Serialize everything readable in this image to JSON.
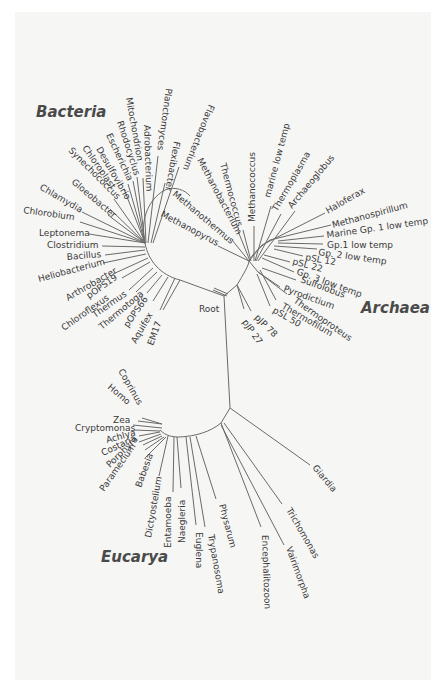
{
  "diagram": {
    "type": "unrooted phylogenetic tree",
    "colors": {
      "background": "#ffffff",
      "paper": "#f6f6f5",
      "lines": "#6a6a6a",
      "text": "#3a3a3a",
      "domain_text": "#4a4a4a"
    },
    "domains": [
      {
        "id": "bacteria",
        "label": "Bacteria",
        "x": 36,
        "y": 117
      },
      {
        "id": "archaea",
        "label": "Archaea",
        "x": 361,
        "y": 313
      },
      {
        "id": "eucarya",
        "label": "Eucarya",
        "x": 101,
        "y": 562
      }
    ],
    "root": {
      "label": "Root",
      "x": 199,
      "y": 312
    },
    "nodes": {
      "bacteria_hub": [
        145,
        243
      ],
      "archaea_hub": [
        249,
        261
      ],
      "center": [
        224,
        296
      ],
      "eucarya_hub": [
        230,
        408
      ],
      "eucarya_sub": [
        221,
        423
      ],
      "eucarya_arc_start": [
        160,
        424
      ]
    },
    "leaves": [
      {
        "group": "bacteria",
        "label": "Chlamydia",
        "x": 39,
        "y": 189,
        "angle": 30,
        "line": [
          [
            82,
            212
          ],
          [
            145,
            243
          ]
        ]
      },
      {
        "group": "bacteria",
        "label": "Chlorobium",
        "x": 23,
        "y": 213,
        "angle": 8,
        "line": [
          [
            80,
            222
          ],
          [
            145,
            243
          ]
        ]
      },
      {
        "group": "bacteria",
        "label": "Leptonema",
        "x": 39,
        "y": 236,
        "angle": 0,
        "line": [
          [
            89,
            234
          ],
          [
            145,
            243
          ]
        ]
      },
      {
        "group": "bacteria",
        "label": "Clostridium",
        "x": 47,
        "y": 248,
        "angle": 0,
        "line": [
          [
            102,
            246
          ],
          [
            145,
            247
          ]
        ]
      },
      {
        "group": "bacteria",
        "label": "Bacillus",
        "x": 67,
        "y": 260,
        "angle": -5,
        "line": [
          [
            105,
            255
          ],
          [
            145,
            250
          ]
        ]
      },
      {
        "group": "bacteria",
        "label": "Heliobacterium",
        "x": 39,
        "y": 282,
        "angle": -15,
        "line": [
          [
            103,
            263
          ],
          [
            146,
            254
          ]
        ]
      },
      {
        "group": "bacteria",
        "label": "Arthrobacter",
        "x": 68,
        "y": 301,
        "angle": -30,
        "line": [
          [
            113,
            274
          ],
          [
            148,
            258
          ]
        ]
      },
      {
        "group": "bacteria",
        "label": "pOPS19",
        "x": 89,
        "y": 299,
        "angle": -35,
        "line": [
          [
            122,
            278
          ],
          [
            150,
            262
          ]
        ]
      },
      {
        "group": "bacteria",
        "label": "Chloroflexus",
        "x": 64,
        "y": 331,
        "angle": -35,
        "line": [
          [
            129,
            290
          ],
          [
            153,
            268
          ]
        ]
      },
      {
        "group": "bacteria",
        "label": "Thermus",
        "x": 95,
        "y": 318,
        "angle": -35,
        "line": [
          [
            136,
            292
          ],
          [
            157,
            272
          ]
        ]
      },
      {
        "group": "bacteria",
        "label": "Thermotoga",
        "x": 102,
        "y": 330,
        "angle": -40,
        "line": [
          [
            147,
            293
          ],
          [
            162,
            275
          ]
        ]
      },
      {
        "group": "bacteria",
        "label": "pOPS66",
        "x": 128,
        "y": 328,
        "angle": -55,
        "line": [
          [
            153,
            301
          ],
          [
            168,
            277
          ]
        ]
      },
      {
        "group": "bacteria",
        "label": "Aquifex",
        "x": 136,
        "y": 344,
        "angle": -60,
        "line": [
          [
            160,
            310
          ],
          [
            175,
            278
          ]
        ]
      },
      {
        "group": "bacteria",
        "label": "EM17",
        "x": 153,
        "y": 346,
        "angle": -70,
        "line": [
          [
            163,
            310
          ],
          [
            180,
            280
          ]
        ]
      },
      {
        "group": "bacteria",
        "label": "Synechococcus",
        "x": 68,
        "y": 151,
        "angle": 45,
        "line": [
          [
            110,
            209
          ],
          [
            145,
            243
          ]
        ]
      },
      {
        "group": "bacteria",
        "label": "Chloroplast",
        "x": 82,
        "y": 148,
        "angle": 55,
        "line": [
          [
            114,
            199
          ],
          [
            145,
            243
          ]
        ]
      },
      {
        "group": "bacteria",
        "label": "Gloeobacter",
        "x": 71,
        "y": 183,
        "angle": 40,
        "line": [
          [
            108,
            215
          ],
          [
            145,
            243
          ]
        ]
      },
      {
        "group": "bacteria",
        "label": "Desulfovibrio",
        "x": 96,
        "y": 149,
        "angle": 60,
        "line": [
          [
            124,
            189
          ],
          [
            145,
            243
          ]
        ]
      },
      {
        "group": "bacteria",
        "label": "Escherichia",
        "x": 106,
        "y": 135,
        "angle": 65,
        "line": [
          [
            128,
            184
          ],
          [
            145,
            243
          ]
        ]
      },
      {
        "group": "bacteria",
        "label": "Rhodocyclus",
        "x": 117,
        "y": 122,
        "angle": 72,
        "line": [
          [
            133,
            181
          ],
          [
            145,
            243
          ]
        ]
      },
      {
        "group": "bacteria",
        "label": "Mitochondrion",
        "x": 126,
        "y": 98,
        "angle": 80,
        "line": [
          [
            137,
            177
          ],
          [
            145,
            243
          ]
        ]
      },
      {
        "group": "bacteria",
        "label": "Adrobacterium",
        "x": 144,
        "y": 125,
        "angle": 88,
        "line": [
          [
            143,
            178
          ],
          [
            146,
            243
          ]
        ]
      },
      {
        "group": "bacteria",
        "label": "Planctomyces",
        "x": 166,
        "y": 88,
        "angle": 98,
        "line": [
          [
            158,
            156
          ],
          [
            148,
            243
          ]
        ]
      },
      {
        "group": "bacteria",
        "label": "Flexibacter",
        "x": 174,
        "y": 141,
        "angle": 100,
        "line": [
          [
            165,
            183
          ],
          [
            151,
            243
          ]
        ]
      },
      {
        "group": "bacteria",
        "label": "Flavobacterium",
        "x": 209,
        "y": 104,
        "angle": 112,
        "line": [
          [
            179,
            167
          ],
          [
            153,
            243
          ]
        ]
      },
      {
        "group": "archaea",
        "label": "Methanopyrus",
        "x": 160,
        "y": 216,
        "angle": 28,
        "line": [
          [
            218,
            246
          ],
          [
            249,
            261
          ]
        ]
      },
      {
        "group": "archaea",
        "label": "Methanothermus",
        "x": 172,
        "y": 195,
        "angle": 40,
        "line": [
          [
            232,
            240
          ],
          [
            249,
            261
          ]
        ]
      },
      {
        "group": "archaea",
        "label": "Methanobacterium",
        "x": 197,
        "y": 160,
        "angle": 62,
        "line": [
          [
            238,
            231
          ],
          [
            250,
            261
          ]
        ]
      },
      {
        "group": "archaea",
        "label": "Thermococcus",
        "x": 220,
        "y": 164,
        "angle": 75,
        "line": [
          [
            243,
            230
          ],
          [
            251,
            261
          ]
        ]
      },
      {
        "group": "archaea",
        "label": "Methanococcus",
        "x": 255,
        "y": 222,
        "angle": -90,
        "line": [
          [
            254,
            226
          ],
          [
            254,
            261
          ]
        ]
      },
      {
        "group": "archaea",
        "label": "marine low temp",
        "x": 270,
        "y": 198,
        "angle": -75,
        "line": [
          [
            271,
            206
          ],
          [
            255,
            261
          ]
        ]
      },
      {
        "group": "archaea",
        "label": "Thermoplasma",
        "x": 277,
        "y": 212,
        "angle": -60,
        "line": [
          [
            281,
            214
          ],
          [
            256,
            261
          ]
        ]
      },
      {
        "group": "archaea",
        "label": "Archaeoglobus",
        "x": 292,
        "y": 209,
        "angle": -50,
        "line": [
          [
            295,
            211
          ],
          [
            258,
            261
          ]
        ]
      },
      {
        "group": "archaea",
        "label": "Haloferax",
        "x": 328,
        "y": 214,
        "angle": -30,
        "line": [
          [
            325,
            213
          ],
          [
            262,
            245
          ]
        ]
      },
      {
        "group": "archaea",
        "label": "Methanospirillum",
        "x": 333,
        "y": 228,
        "angle": -15,
        "line": [
          [
            331,
            225
          ],
          [
            270,
            240
          ]
        ]
      },
      {
        "group": "archaea",
        "label": "Marine Gp. 1 low temp",
        "x": 327,
        "y": 238,
        "angle": -8,
        "line": [
          [
            324,
            236
          ],
          [
            278,
            241
          ]
        ]
      },
      {
        "group": "archaea",
        "label": "Gp.1 low temp",
        "x": 327,
        "y": 248,
        "angle": 0,
        "line": [
          [
            323,
            244
          ],
          [
            278,
            243
          ]
        ]
      },
      {
        "group": "archaea",
        "label": "Gp. 2 low temp",
        "x": 318,
        "y": 255,
        "angle": 8,
        "line": [
          [
            317,
            249
          ],
          [
            274,
            246
          ]
        ]
      },
      {
        "group": "archaea",
        "label": "pSL 12",
        "x": 305,
        "y": 260,
        "angle": 10,
        "line": [
          [
            303,
            256
          ],
          [
            274,
            249
          ]
        ]
      },
      {
        "group": "archaea",
        "label": "pSL 22",
        "x": 292,
        "y": 264,
        "angle": 15,
        "line": [
          [
            290,
            262
          ],
          [
            264,
            255
          ]
        ]
      },
      {
        "group": "archaea",
        "label": "Gp. 3 low temp",
        "x": 296,
        "y": 274,
        "angle": 20,
        "line": [
          [
            294,
            272
          ],
          [
            262,
            258
          ]
        ]
      },
      {
        "group": "archaea",
        "label": "Sulfolobus",
        "x": 300,
        "y": 282,
        "angle": 20,
        "line": [
          [
            296,
            280
          ],
          [
            262,
            268
          ]
        ]
      },
      {
        "group": "archaea",
        "label": "Pyrodictium",
        "x": 283,
        "y": 291,
        "angle": 20,
        "line": [
          [
            280,
            287
          ],
          [
            258,
            272
          ]
        ]
      },
      {
        "group": "archaea",
        "label": "Thermoproteus",
        "x": 293,
        "y": 302,
        "angle": 35,
        "line": [
          [
            287,
            294
          ],
          [
            258,
            272
          ]
        ]
      },
      {
        "group": "archaea",
        "label": "Thermofilum",
        "x": 281,
        "y": 308,
        "angle": 30,
        "line": [
          [
            276,
            300
          ],
          [
            260,
            270
          ]
        ]
      },
      {
        "group": "archaea",
        "label": "pSL 50",
        "x": 272,
        "y": 312,
        "angle": 30,
        "line": [
          [
            270,
            306
          ],
          [
            257,
            274
          ]
        ]
      },
      {
        "group": "archaea",
        "label": "pJP 78",
        "x": 254,
        "y": 318,
        "angle": 45,
        "line": [
          [
            251,
            311
          ],
          [
            237,
            285
          ]
        ]
      },
      {
        "group": "archaea",
        "label": "pJP 27",
        "x": 242,
        "y": 322,
        "angle": 55,
        "line": [
          [
            244,
            309
          ],
          [
            237,
            285
          ]
        ]
      },
      {
        "group": "eucarya",
        "label": "Coprinus",
        "x": 118,
        "y": 371,
        "angle": 60,
        "line": [
          [
            142,
            418
          ],
          [
            162,
            424
          ]
        ]
      },
      {
        "group": "eucarya",
        "label": "Homo",
        "x": 107,
        "y": 388,
        "angle": 40,
        "line": [
          [
            138,
            421
          ],
          [
            162,
            424
          ]
        ]
      },
      {
        "group": "eucarya",
        "label": "Zea",
        "x": 113,
        "y": 423,
        "angle": 0,
        "line": [
          [
            133,
            425
          ],
          [
            162,
            428
          ]
        ]
      },
      {
        "group": "eucarya",
        "label": "Cryptomonas",
        "x": 75,
        "y": 431,
        "angle": 0,
        "line": [
          [
            134,
            430
          ],
          [
            160,
            431
          ]
        ]
      },
      {
        "group": "eucarya",
        "label": "Achlya",
        "x": 107,
        "y": 443,
        "angle": -15,
        "line": [
          [
            139,
            436
          ],
          [
            160,
            432
          ]
        ]
      },
      {
        "group": "eucarya",
        "label": "Costaria",
        "x": 103,
        "y": 456,
        "angle": -25,
        "line": [
          [
            139,
            442
          ],
          [
            161,
            434
          ]
        ]
      },
      {
        "group": "eucarya",
        "label": "Porphyra",
        "x": 110,
        "y": 468,
        "angle": -45,
        "line": [
          [
            143,
            445
          ],
          [
            162,
            436
          ]
        ]
      },
      {
        "group": "eucarya",
        "label": "Paramecium",
        "x": 104,
        "y": 492,
        "angle": -55,
        "line": [
          [
            145,
            450
          ],
          [
            164,
            437
          ]
        ]
      },
      {
        "group": "eucarya",
        "label": "Babesia",
        "x": 141,
        "y": 488,
        "angle": -70,
        "line": [
          [
            145,
            458
          ],
          [
            166,
            437
          ]
        ]
      },
      {
        "group": "eucarya",
        "label": "Dictyostelium",
        "x": 151,
        "y": 538,
        "angle": -80,
        "line": [
          [
            159,
            476
          ],
          [
            168,
            436
          ]
        ]
      },
      {
        "group": "eucarya",
        "label": "Entamoeba",
        "x": 171,
        "y": 548,
        "angle": -90,
        "line": [
          [
            173,
            492
          ],
          [
            174,
            437
          ]
        ]
      },
      {
        "group": "eucarya",
        "label": "Naegleria",
        "x": 185,
        "y": 543,
        "angle": -90,
        "line": [
          [
            181,
            488
          ],
          [
            177,
            437
          ]
        ]
      },
      {
        "group": "eucarya",
        "label": "Euglena",
        "x": 196,
        "y": 532,
        "angle": 90,
        "line": [
          [
            196,
            525
          ],
          [
            186,
            437
          ]
        ]
      },
      {
        "group": "eucarya",
        "label": "Trypanosoma",
        "x": 208,
        "y": 535,
        "angle": 80,
        "line": [
          [
            205,
            527
          ],
          [
            190,
            437
          ]
        ]
      },
      {
        "group": "eucarya",
        "label": "Physarum",
        "x": 219,
        "y": 505,
        "angle": 75,
        "line": [
          [
            216,
            499
          ],
          [
            196,
            436
          ]
        ]
      },
      {
        "group": "eucarya",
        "label": "Encephalitozoon",
        "x": 262,
        "y": 535,
        "angle": 88,
        "line": [
          [
            261,
            527
          ],
          [
            221,
            423
          ]
        ]
      },
      {
        "group": "eucarya",
        "label": "Vairimorpha",
        "x": 286,
        "y": 548,
        "angle": 70,
        "line": [
          [
            284,
            545
          ],
          [
            221,
            425
          ]
        ]
      },
      {
        "group": "eucarya",
        "label": "Trichomonas",
        "x": 286,
        "y": 510,
        "angle": 60,
        "line": [
          [
            282,
            504
          ],
          [
            224,
            423
          ]
        ]
      },
      {
        "group": "eucarya",
        "label": "Giardia",
        "x": 312,
        "y": 468,
        "angle": 50,
        "line": [
          [
            310,
            465
          ],
          [
            230,
            408
          ]
        ]
      }
    ]
  }
}
